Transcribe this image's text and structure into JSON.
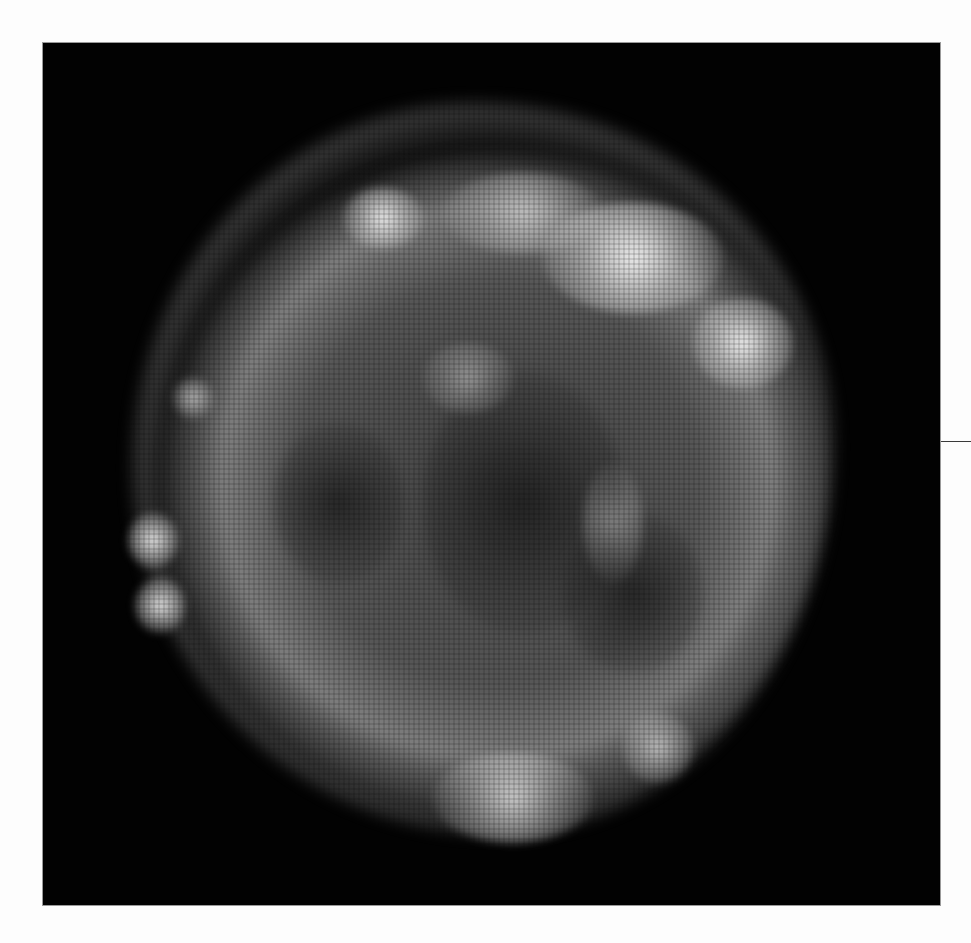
{
  "image": {
    "subject": "supernova-remnant",
    "description": "Grayscale X-ray image of a roughly circular supernova remnant shell on a black background",
    "colors": {
      "page_background": "#fdfdfd",
      "frame_background": "#020202",
      "leader_line": "#3a3a3a"
    },
    "bright_knots": [
      {
        "name": "top-right-rim",
        "x": 640,
        "y": 255
      },
      {
        "name": "right-rim",
        "x": 735,
        "y": 340
      },
      {
        "name": "top-left-rim",
        "x": 370,
        "y": 210
      },
      {
        "name": "left-edge-upper",
        "x": 148,
        "y": 540
      },
      {
        "name": "left-edge-lower",
        "x": 158,
        "y": 602
      },
      {
        "name": "bottom-rim",
        "x": 495,
        "y": 790
      },
      {
        "name": "bottom-right",
        "x": 655,
        "y": 740
      }
    ]
  }
}
